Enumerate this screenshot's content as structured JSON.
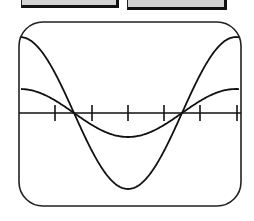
{
  "buttons": [
    {
      "label": "",
      "note": "text cropped at top edge"
    },
    {
      "label": "",
      "note": "text cropped at top edge"
    }
  ],
  "graph": {
    "frame": {
      "x": 19,
      "y": 22,
      "width": 222,
      "height": 184,
      "corner_radius": 24
    },
    "axis_y": 113,
    "x_range": [
      21,
      239
    ],
    "ticks_x": [
      55,
      92,
      128,
      164,
      200,
      237
    ],
    "center_x": 128,
    "period_px": 216,
    "curves": [
      {
        "name": "large-cosine",
        "amplitude_px": 76,
        "color": "#111111"
      },
      {
        "name": "small-cosine",
        "amplitude_px": 24,
        "color": "#111111"
      }
    ]
  },
  "colors": {
    "line": "#111111",
    "button_fill": "#d2d2d2",
    "background": "#ffffff"
  }
}
